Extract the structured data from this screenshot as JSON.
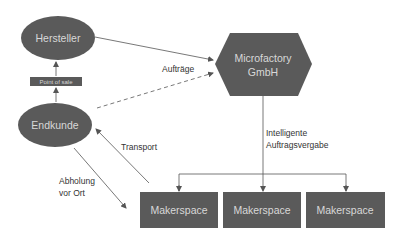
{
  "colors": {
    "node_fill": "#5a5a5a",
    "node_text": "#d8d8d8",
    "edge": "#555555",
    "label": "#333333",
    "background": "#ffffff"
  },
  "nodes": {
    "hersteller": {
      "label": "Hersteller",
      "shape": "ellipse"
    },
    "point_of_sale": {
      "label": "Point of sale",
      "shape": "rectangle"
    },
    "endkunde": {
      "label": "Endkunde",
      "shape": "ellipse"
    },
    "microfactory": {
      "label_line1": "Microfactory",
      "label_line2": "GmbH",
      "shape": "hexagon"
    },
    "makerspaces": [
      {
        "label": "Makerspace",
        "shape": "rectangle"
      },
      {
        "label": "Makerspace",
        "shape": "rectangle"
      },
      {
        "label": "Makerspace",
        "shape": "rectangle"
      }
    ]
  },
  "edges": {
    "auftraege": {
      "label": "Aufträge",
      "from": "Hersteller / Endkunde",
      "to": "Microfactory GmbH"
    },
    "intelligente_auftragsvergabe": {
      "label_line1": "Intelligente",
      "label_line2": "Auftragsvergabe",
      "from": "Microfactory GmbH",
      "to": "Makerspace"
    },
    "transport": {
      "label": "Transport",
      "from": "Makerspace",
      "to": "Endkunde"
    },
    "abholung": {
      "label_line1": "Abholung",
      "label_line2": "vor Ort",
      "from": "Endkunde",
      "to": "Makerspace"
    }
  }
}
